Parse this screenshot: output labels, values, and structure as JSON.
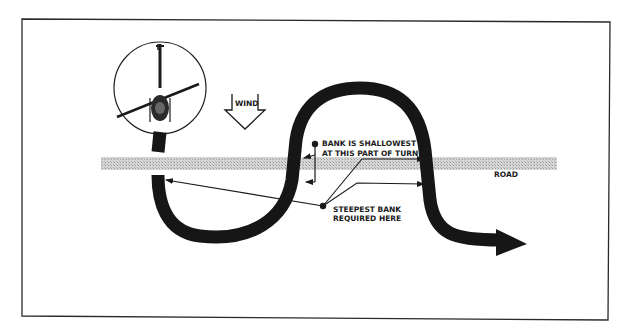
{
  "diagram": {
    "type": "helicopter-s-turn-across-road",
    "labels": {
      "wind": "WIND",
      "road": "ROAD",
      "shallow_line1": "BANK IS SHALLOWEST",
      "shallow_line2": "AT THIS PART OF TURN",
      "steep_line1": "STEEPEST BANK",
      "steep_line2": "REQUIRED HERE"
    },
    "colors": {
      "ink": "#1a1a1a",
      "road": "#c8c8c8",
      "background": "#ffffff"
    },
    "icons": [
      "helicopter-icon",
      "wind-arrow-icon",
      "flight-path-arrow"
    ]
  }
}
